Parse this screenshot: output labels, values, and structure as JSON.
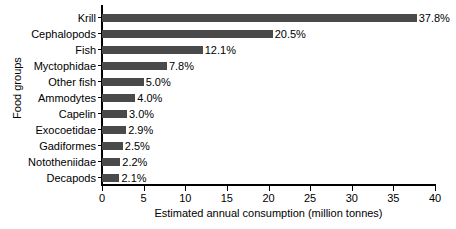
{
  "chart_data": {
    "type": "bar",
    "orientation": "horizontal",
    "title": "",
    "xlabel": "Estimated annual consumption (million tonnes)",
    "ylabel": "Food groups",
    "xlim": [
      0,
      40
    ],
    "xticks": [
      0,
      5,
      10,
      15,
      20,
      25,
      30,
      35,
      40
    ],
    "grid": false,
    "legend": null,
    "bar_color": "#4a4a4a",
    "categories": [
      "Krill",
      "Cephalopods",
      "Fish",
      "Myctophidae",
      "Other fish",
      "Ammodytes",
      "Capelin",
      "Exocoetidae",
      "Gadiformes",
      "Nototheniidae",
      "Decapods"
    ],
    "values": [
      37.8,
      20.5,
      12.1,
      7.8,
      5.0,
      4.0,
      3.0,
      2.9,
      2.5,
      2.2,
      2.1
    ],
    "data_labels": [
      "37.8%",
      "20.5%",
      "12.1%",
      "7.8%",
      "5.0%",
      "4.0%",
      "3.0%",
      "2.9%",
      "2.5%",
      "2.2%",
      "2.1%"
    ]
  }
}
